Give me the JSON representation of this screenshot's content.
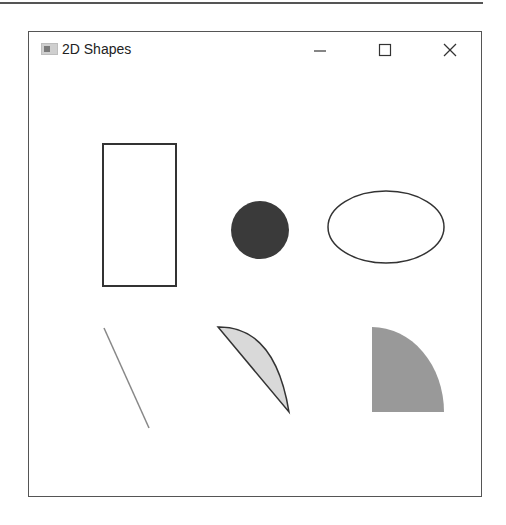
{
  "window": {
    "title": "2D Shapes",
    "controls": {
      "minimize_icon": "minimize-icon",
      "maximize_icon": "maximize-icon",
      "close_icon": "close-icon"
    }
  },
  "shapes": [
    {
      "type": "rectangle",
      "name": "rectangle-outline",
      "x": 102,
      "y": 143,
      "width": 73,
      "height": 142,
      "stroke": "#333333",
      "fill": "none"
    },
    {
      "type": "circle",
      "name": "filled-circle",
      "cx": 259,
      "cy": 229,
      "r": 29,
      "fill": "#3a3a3a"
    },
    {
      "type": "ellipse",
      "name": "ellipse-outline",
      "cx": 385,
      "cy": 226,
      "rx": 58,
      "ry": 36,
      "stroke": "#333333",
      "fill": "none"
    },
    {
      "type": "line",
      "name": "diagonal-line",
      "x1": 103,
      "y1": 327,
      "x2": 148,
      "y2": 427,
      "stroke": "#888888"
    },
    {
      "type": "chord",
      "name": "arc-chord",
      "x1": 217,
      "y1": 326,
      "x2": 288,
      "y2": 411,
      "fill": "#d9d9d9",
      "stroke": "#333333"
    },
    {
      "type": "pie",
      "name": "quarter-pie",
      "cx": 371,
      "cy": 411,
      "rx": 72,
      "ry": 85,
      "fill": "#999999"
    }
  ],
  "colors": {
    "border": "#555555",
    "background": "#ffffff"
  }
}
